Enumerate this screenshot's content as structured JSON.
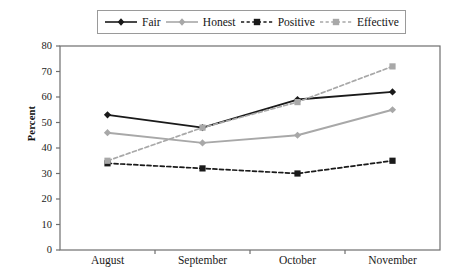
{
  "chart_data": {
    "type": "line",
    "title": "",
    "xlabel": "",
    "ylabel": "Percent",
    "categories": [
      "August",
      "September",
      "October",
      "November"
    ],
    "ylim": [
      0,
      80
    ],
    "ytick_step": 10,
    "yticks": [
      0,
      10,
      20,
      30,
      40,
      50,
      60,
      70,
      80
    ],
    "grid": false,
    "legend_position": "top",
    "series": [
      {
        "name": "Fair",
        "values": [
          53,
          48,
          59,
          62
        ],
        "color": "#1a1a1a",
        "line_style": "solid",
        "marker": "diamond"
      },
      {
        "name": "Honest",
        "values": [
          46,
          42,
          45,
          55
        ],
        "color": "#a8a8a8",
        "line_style": "solid",
        "marker": "diamond"
      },
      {
        "name": "Positive",
        "values": [
          34,
          32,
          30,
          35
        ],
        "color": "#1a1a1a",
        "line_style": "dashed",
        "marker": "square"
      },
      {
        "name": "Effective",
        "values": [
          35,
          48,
          58,
          72
        ],
        "color": "#a8a8a8",
        "line_style": "dashed",
        "marker": "square"
      }
    ]
  },
  "axes": {
    "frame_color": "#6e6e6e"
  }
}
